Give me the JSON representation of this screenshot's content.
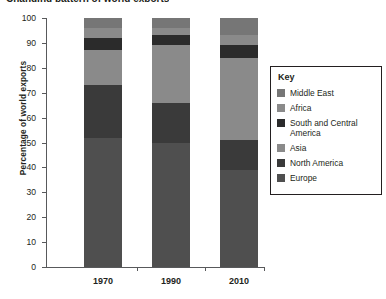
{
  "figure": {
    "clipped_title": "Changing pattern of world exports",
    "background": "#ffffff"
  },
  "legend": {
    "title": "Key",
    "position": "right",
    "items": [
      {
        "label": "Middle East",
        "color": "#767676"
      },
      {
        "label": "Africa",
        "color": "#8a8a8a"
      },
      {
        "label": "South and Central America",
        "color": "#2b2b2b"
      },
      {
        "label": "Asia",
        "color": "#8a8a8a"
      },
      {
        "label": "North America",
        "color": "#3a3a3a"
      },
      {
        "label": "Europe",
        "color": "#4f4f4f"
      }
    ]
  },
  "chart_data": {
    "type": "bar",
    "stacked": true,
    "title": "Changing pattern of world exports",
    "xlabel": "",
    "ylabel": "Percentage of world exports",
    "ylim": [
      0,
      100
    ],
    "yticks": [
      0,
      10,
      20,
      30,
      40,
      50,
      60,
      70,
      80,
      90,
      100
    ],
    "grid": false,
    "legend_position": "right",
    "categories": [
      "1970",
      "1990",
      "2010"
    ],
    "series": [
      {
        "name": "Europe",
        "color": "#4f4f4f",
        "values": [
          52,
          50,
          39
        ]
      },
      {
        "name": "North America",
        "color": "#3a3a3a",
        "values": [
          21,
          16,
          12
        ]
      },
      {
        "name": "Asia",
        "color": "#8a8a8a",
        "values": [
          14,
          23,
          33
        ]
      },
      {
        "name": "South and Central America",
        "color": "#2b2b2b",
        "values": [
          5,
          4,
          5
        ]
      },
      {
        "name": "Africa",
        "color": "#8a8a8a",
        "values": [
          4,
          3,
          4
        ]
      },
      {
        "name": "Middle East",
        "color": "#767676",
        "values": [
          4,
          4,
          7
        ]
      }
    ]
  }
}
